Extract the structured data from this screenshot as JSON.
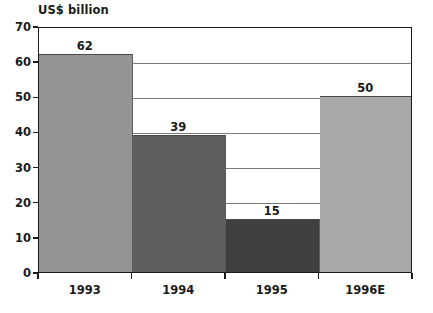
{
  "chart_data": {
    "type": "bar",
    "title": "US$ billion",
    "xlabel": "",
    "ylabel": "US$ billion",
    "categories": [
      "1993",
      "1994",
      "1995",
      "1996E"
    ],
    "values": [
      62,
      39,
      15,
      50
    ],
    "value_labels": [
      "62",
      "39",
      "15",
      "50"
    ],
    "ylim": [
      0,
      70
    ],
    "ytick_labels": [
      "0",
      "10",
      "20",
      "30",
      "40",
      "50",
      "60",
      "70"
    ],
    "ytick_values": [
      0,
      10,
      20,
      30,
      40,
      50,
      60,
      70
    ],
    "grid": true,
    "grid_orientation": "horizontal",
    "legend": false,
    "bar_colors": [
      "#949494",
      "#5e5e5e",
      "#3f3f3f",
      "#a8a8a8"
    ],
    "series": [
      {
        "name": "US$ billion",
        "values": [
          62,
          39,
          15,
          50
        ]
      }
    ]
  },
  "style": {
    "axis_color": "#1a1a1a",
    "grid_color": "#7d7d7d",
    "background": "#ffffff",
    "text_color": "#1a1a1a"
  }
}
